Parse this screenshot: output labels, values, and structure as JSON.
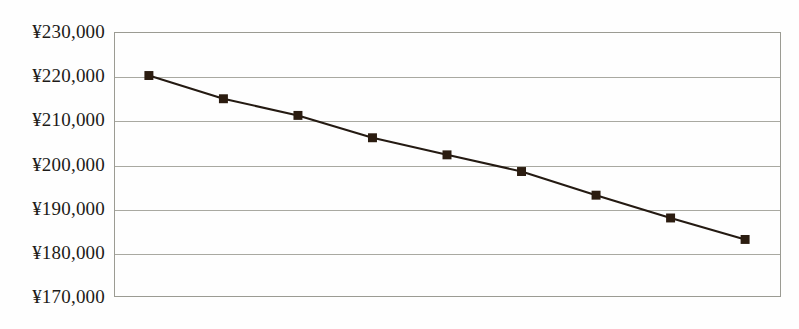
{
  "chart_data": {
    "type": "line",
    "title": "",
    "xlabel": "",
    "ylabel": "",
    "ylim": [
      170000,
      230000
    ],
    "ytick_step": 10000,
    "ytick_labels": [
      "¥230,000",
      "¥220,000",
      "¥210,000",
      "¥200,000",
      "¥190,000",
      "¥180,000",
      "¥170,000"
    ],
    "ytick_values": [
      230000,
      220000,
      210000,
      200000,
      190000,
      180000,
      170000
    ],
    "grid": true,
    "grid_axis": "y",
    "legend": "none",
    "x": [
      1,
      2,
      3,
      4,
      5,
      6,
      7,
      8,
      9
    ],
    "xtick_labels": [],
    "series": [
      {
        "name": "series-1",
        "marker": "square",
        "marker_color": "#2b1c10",
        "line_color": "#241a12",
        "values": [
          220300,
          215000,
          211200,
          206100,
          202200,
          198400,
          193000,
          187800,
          182900
        ]
      }
    ],
    "colors": {
      "line": "#241a12",
      "marker": "#2b1c10",
      "grid": "#a9a9a1",
      "frame": "#9b9b93",
      "background": "#fefefe",
      "label_text": "#1d1b18"
    }
  }
}
